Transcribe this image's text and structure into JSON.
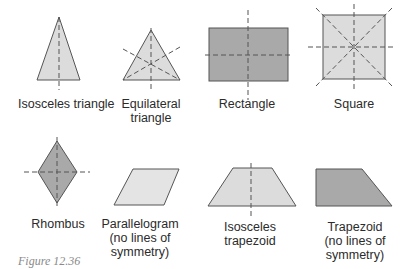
{
  "colors": {
    "light_fill": "#dcdcdc",
    "dark_fill": "#a9a9a9",
    "stroke": "#555555",
    "dash": "#555555"
  },
  "shapes": [
    {
      "id": "isosceles-triangle",
      "label": "Isosceles triangle"
    },
    {
      "id": "equilateral-triangle",
      "label_line1": "Equilateral",
      "label_line2": "triangle"
    },
    {
      "id": "rectangle",
      "label": "Rectangle"
    },
    {
      "id": "square",
      "label": "Square"
    },
    {
      "id": "rhombus",
      "label": "Rhombus"
    },
    {
      "id": "parallelogram",
      "label_line1": "Parallelogram",
      "label_line2": "(no lines of",
      "label_line3": "symmetry)"
    },
    {
      "id": "isosceles-trapezoid",
      "label_line1": "Isosceles",
      "label_line2": "trapezoid"
    },
    {
      "id": "trapezoid",
      "label_line1": "Trapezoid",
      "label_line2": "(no lines of",
      "label_line3": "symmetry)"
    }
  ],
  "caption": "Figure 12.36"
}
